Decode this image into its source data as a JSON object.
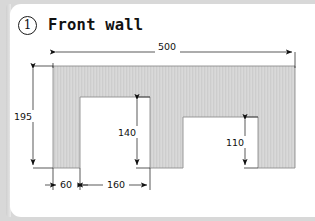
{
  "page": {
    "background_color": "#d8d8d8",
    "card_color": "#ffffff"
  },
  "header": {
    "step_number": "1",
    "title": "Front wall",
    "badge_icon": "circled-number-icon"
  },
  "drawing": {
    "type": "technical-dimension-drawing",
    "fill_color": "#d4d4d4",
    "outline_color": "#8a8a8a",
    "dimension_color": "#111111",
    "shape_description": "front wall elevation with two door openings",
    "dimensions": [
      {
        "name": "overall-width",
        "label": "500",
        "orientation": "horizontal",
        "position": "top"
      },
      {
        "name": "overall-height",
        "label": "195",
        "orientation": "vertical",
        "position": "left"
      },
      {
        "name": "left-pier-width",
        "label": "60",
        "orientation": "horizontal",
        "position": "bottom"
      },
      {
        "name": "first-opening-width",
        "label": "160",
        "orientation": "horizontal",
        "position": "bottom"
      },
      {
        "name": "first-opening-height",
        "label": "140",
        "orientation": "vertical",
        "position": "inside-first-opening"
      },
      {
        "name": "second-opening-height",
        "label": "110",
        "orientation": "vertical",
        "position": "inside-second-opening"
      }
    ]
  }
}
